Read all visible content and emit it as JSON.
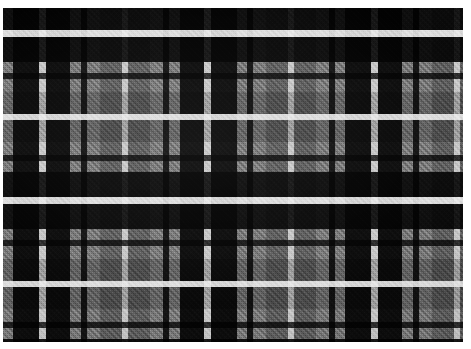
{
  "image": {
    "title": "Tartan Plaid Fabric Swatch",
    "subject": "woven check textile",
    "width": 471,
    "height": 349,
    "page_background": "#ffffff"
  },
  "swatch": {
    "name": "fabric-swatch",
    "left": 3,
    "top": 8,
    "width": 460,
    "height": 334,
    "ground_color": "#8e8e8e",
    "weave": "twill",
    "weave_angle_deg": 45
  },
  "palette": {
    "black": "#0d0d0d",
    "near_black": "#151515",
    "dark_grey": "#343434",
    "mid_dark_grey": "#4e4e4e",
    "mid_grey": "#6d6d6d",
    "light_grey": "#8e8e8e",
    "pale_grey": "#9a9a9a",
    "white_accent": "#e6e6e6",
    "off_white": "#d2d2d2"
  },
  "chart_data": {
    "type": "heatmap",
    "xlabel": "warp position (px)",
    "ylabel": "weft position (px)",
    "grid": true,
    "legend": "none",
    "warp_sett": [
      {
        "color": "#8e8e8e",
        "start": 0,
        "width": 14
      },
      {
        "color": "#0d0d0d",
        "start": 14,
        "width": 28
      },
      {
        "color": "#e6e6e6",
        "start": 42,
        "width": 6
      },
      {
        "color": "#0d0d0d",
        "start": 48,
        "width": 26
      },
      {
        "color": "#8e8e8e",
        "start": 74,
        "width": 10
      },
      {
        "color": "#151515",
        "start": 84,
        "width": 7
      },
      {
        "color": "#8e8e8e",
        "start": 91,
        "width": 12
      },
      {
        "color": "#6d6d6d",
        "start": 103,
        "width": 22
      },
      {
        "color": "#151515",
        "start": 125,
        "width": 7
      },
      {
        "color": "#6d6d6d",
        "start": 132,
        "width": 22
      },
      {
        "color": "#8e8e8e",
        "start": 154,
        "width": 12
      },
      {
        "color": "#151515",
        "start": 166,
        "width": 7
      },
      {
        "color": "#8e8e8e",
        "start": 173,
        "width": 10
      },
      {
        "color": "#0d0d0d",
        "start": 183,
        "width": 26
      },
      {
        "color": "#e6e6e6",
        "start": 209,
        "width": 6
      },
      {
        "color": "#0d0d0d",
        "start": 215,
        "width": 28
      },
      {
        "color": "#8e8e8e",
        "start": 243,
        "width": 14
      }
    ],
    "weft_sett": [
      {
        "color": "#8e8e8e",
        "start": 0,
        "height": 12
      },
      {
        "color": "#0d0d0d",
        "start": 12,
        "height": 26
      },
      {
        "color": "#e6e6e6",
        "start": 38,
        "height": 6
      },
      {
        "color": "#0d0d0d",
        "start": 44,
        "height": 26
      },
      {
        "color": "#8e8e8e",
        "start": 70,
        "height": 10
      },
      {
        "color": "#151515",
        "start": 80,
        "height": 7
      },
      {
        "color": "#8e8e8e",
        "start": 87,
        "height": 12
      },
      {
        "color": "#6d6d6d",
        "start": 99,
        "height": 22
      },
      {
        "color": "#151515",
        "start": 121,
        "height": 7
      },
      {
        "color": "#6d6d6d",
        "start": 128,
        "height": 22
      },
      {
        "color": "#8e8e8e",
        "start": 150,
        "height": 12
      },
      {
        "color": "#151515",
        "start": 162,
        "height": 7
      },
      {
        "color": "#8e8e8e",
        "start": 169,
        "height": 10
      },
      {
        "color": "#0d0d0d",
        "start": 179,
        "height": 26
      },
      {
        "color": "#e6e6e6",
        "start": 205,
        "height": 6
      },
      {
        "color": "#0d0d0d",
        "start": 211,
        "height": 26
      },
      {
        "color": "#8e8e8e",
        "start": 237,
        "height": 12
      }
    ]
  },
  "warp_stripes": [
    {
      "x": 0,
      "w": 10,
      "color": "#8e8e8e",
      "kind": "ground"
    },
    {
      "x": 10,
      "w": 26,
      "color": "#0d0d0d",
      "kind": "block"
    },
    {
      "x": 36,
      "w": 7,
      "color": "#e6e6e6",
      "kind": "accent"
    },
    {
      "x": 43,
      "w": 24,
      "color": "#0d0d0d",
      "kind": "block"
    },
    {
      "x": 67,
      "w": 11,
      "color": "#8e8e8e",
      "kind": "ground"
    },
    {
      "x": 78,
      "w": 6,
      "color": "#151515",
      "kind": "tramline"
    },
    {
      "x": 84,
      "w": 13,
      "color": "#8e8e8e",
      "kind": "ground"
    },
    {
      "x": 97,
      "w": 22,
      "color": "#6d6d6d",
      "kind": "ground-mid"
    },
    {
      "x": 119,
      "w": 6,
      "color": "#e6e6e6",
      "kind": "accent"
    },
    {
      "x": 125,
      "w": 22,
      "color": "#6d6d6d",
      "kind": "ground-mid"
    },
    {
      "x": 147,
      "w": 13,
      "color": "#8e8e8e",
      "kind": "ground"
    },
    {
      "x": 160,
      "w": 6,
      "color": "#151515",
      "kind": "tramline"
    },
    {
      "x": 166,
      "w": 11,
      "color": "#8e8e8e",
      "kind": "ground"
    },
    {
      "x": 177,
      "w": 24,
      "color": "#0d0d0d",
      "kind": "block"
    },
    {
      "x": 201,
      "w": 7,
      "color": "#e6e6e6",
      "kind": "accent"
    },
    {
      "x": 208,
      "w": 26,
      "color": "#0d0d0d",
      "kind": "block"
    },
    {
      "x": 234,
      "w": 10,
      "color": "#8e8e8e",
      "kind": "ground"
    },
    {
      "x": 244,
      "w": 6,
      "color": "#151515",
      "kind": "tramline"
    },
    {
      "x": 250,
      "w": 13,
      "color": "#8e8e8e",
      "kind": "ground"
    },
    {
      "x": 263,
      "w": 22,
      "color": "#6d6d6d",
      "kind": "ground-mid"
    },
    {
      "x": 285,
      "w": 6,
      "color": "#e6e6e6",
      "kind": "accent"
    },
    {
      "x": 291,
      "w": 22,
      "color": "#6d6d6d",
      "kind": "ground-mid"
    },
    {
      "x": 313,
      "w": 13,
      "color": "#8e8e8e",
      "kind": "ground"
    },
    {
      "x": 326,
      "w": 6,
      "color": "#151515",
      "kind": "tramline"
    },
    {
      "x": 332,
      "w": 10,
      "color": "#8e8e8e",
      "kind": "ground"
    },
    {
      "x": 342,
      "w": 26,
      "color": "#0d0d0d",
      "kind": "block"
    },
    {
      "x": 368,
      "w": 7,
      "color": "#e6e6e6",
      "kind": "accent"
    },
    {
      "x": 375,
      "w": 24,
      "color": "#0d0d0d",
      "kind": "block"
    },
    {
      "x": 399,
      "w": 11,
      "color": "#8e8e8e",
      "kind": "ground"
    },
    {
      "x": 410,
      "w": 6,
      "color": "#151515",
      "kind": "tramline"
    },
    {
      "x": 416,
      "w": 13,
      "color": "#8e8e8e",
      "kind": "ground"
    },
    {
      "x": 429,
      "w": 22,
      "color": "#6d6d6d",
      "kind": "ground-mid"
    },
    {
      "x": 451,
      "w": 6,
      "color": "#e6e6e6",
      "kind": "accent"
    },
    {
      "x": 457,
      "w": 3,
      "color": "#6d6d6d",
      "kind": "ground-mid"
    }
  ],
  "weft_stripes": [
    {
      "y": 0,
      "h": 22,
      "color": "#0d0d0d",
      "kind": "block"
    },
    {
      "y": 22,
      "h": 7,
      "color": "#e6e6e6",
      "kind": "accent"
    },
    {
      "y": 29,
      "h": 25,
      "color": "#0d0d0d",
      "kind": "block"
    },
    {
      "y": 54,
      "h": 11,
      "color": "#8e8e8e",
      "kind": "ground"
    },
    {
      "y": 65,
      "h": 6,
      "color": "#151515",
      "kind": "tramline"
    },
    {
      "y": 71,
      "h": 13,
      "color": "#8e8e8e",
      "kind": "ground"
    },
    {
      "y": 84,
      "h": 22,
      "color": "#6d6d6d",
      "kind": "ground-mid"
    },
    {
      "y": 106,
      "h": 6,
      "color": "#e6e6e6",
      "kind": "accent"
    },
    {
      "y": 112,
      "h": 22,
      "color": "#6d6d6d",
      "kind": "ground-mid"
    },
    {
      "y": 134,
      "h": 13,
      "color": "#8e8e8e",
      "kind": "ground"
    },
    {
      "y": 147,
      "h": 6,
      "color": "#151515",
      "kind": "tramline"
    },
    {
      "y": 153,
      "h": 11,
      "color": "#8e8e8e",
      "kind": "ground"
    },
    {
      "y": 164,
      "h": 25,
      "color": "#0d0d0d",
      "kind": "block"
    },
    {
      "y": 189,
      "h": 7,
      "color": "#e6e6e6",
      "kind": "accent"
    },
    {
      "y": 196,
      "h": 25,
      "color": "#0d0d0d",
      "kind": "block"
    },
    {
      "y": 221,
      "h": 11,
      "color": "#8e8e8e",
      "kind": "ground"
    },
    {
      "y": 232,
      "h": 6,
      "color": "#151515",
      "kind": "tramline"
    },
    {
      "y": 238,
      "h": 13,
      "color": "#8e8e8e",
      "kind": "ground"
    },
    {
      "y": 251,
      "h": 22,
      "color": "#6d6d6d",
      "kind": "ground-mid"
    },
    {
      "y": 273,
      "h": 6,
      "color": "#e6e6e6",
      "kind": "accent"
    },
    {
      "y": 279,
      "h": 22,
      "color": "#6d6d6d",
      "kind": "ground-mid"
    },
    {
      "y": 301,
      "h": 13,
      "color": "#8e8e8e",
      "kind": "ground"
    },
    {
      "y": 314,
      "h": 6,
      "color": "#151515",
      "kind": "tramline"
    },
    {
      "y": 320,
      "h": 11,
      "color": "#8e8e8e",
      "kind": "ground"
    },
    {
      "y": 331,
      "h": 3,
      "color": "#0d0d0d",
      "kind": "block"
    }
  ]
}
